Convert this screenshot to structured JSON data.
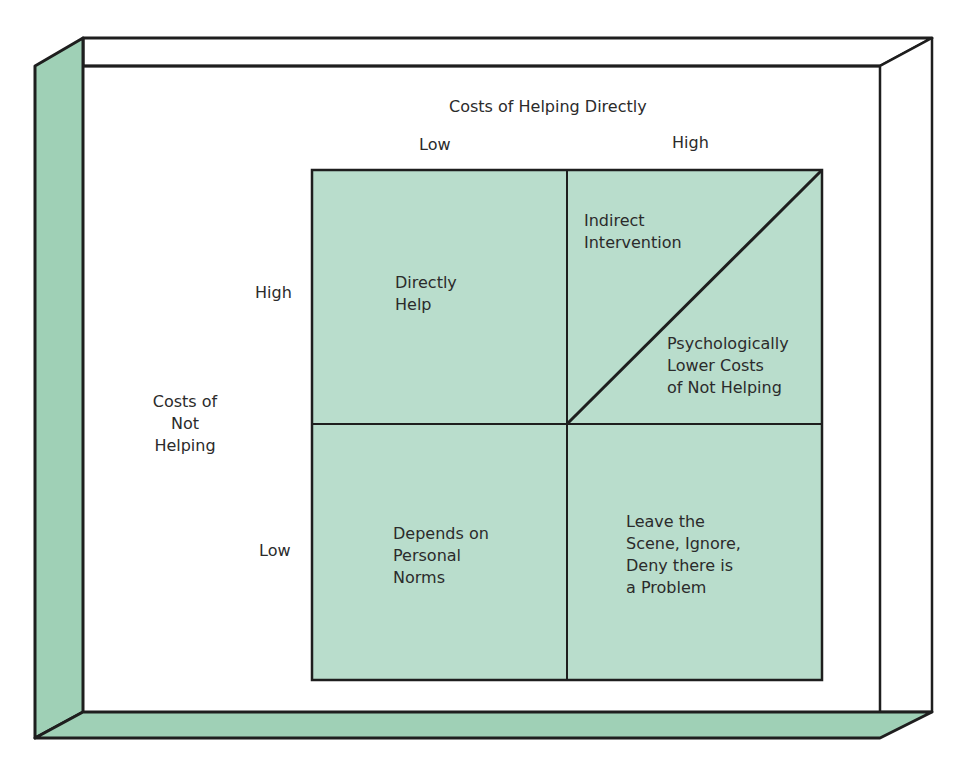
{
  "colors": {
    "fill": "#b9ddcc",
    "frame_side": "#9fd0b6",
    "stroke": "#1e1e1e",
    "background": "#ffffff"
  },
  "diagram": {
    "x_axis": {
      "title": "Costs of Helping Directly",
      "low_label": "Low",
      "high_label": "High"
    },
    "y_axis": {
      "title": "Costs of\nNot\nHelping",
      "high_label": "High",
      "low_label": "Low"
    },
    "quadrants": {
      "high_not_low_help": "Directly\nHelp",
      "high_not_high_help_upper": "Indirect\nIntervention",
      "high_not_high_help_lower": "Psychologically\nLower Costs\nof Not Helping",
      "low_not_low_help": "Depends on\nPersonal\nNorms",
      "low_not_high_help": "Leave the\nScene, Ignore,\nDeny there is\na Problem"
    }
  }
}
